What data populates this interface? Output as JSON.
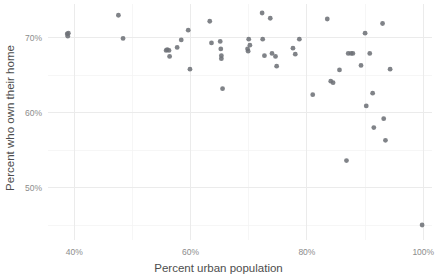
{
  "chart_data": {
    "type": "scatter",
    "title": "",
    "subtitle": "",
    "xlabel": "Percent urban population",
    "ylabel": "Percent who own their home",
    "xlim": [
      35.5,
      101.5
    ],
    "ylim": [
      43.0,
      74.5
    ],
    "x_ticks": [
      40,
      60,
      80,
      100
    ],
    "x_tick_labels": [
      "40%",
      "60%",
      "80%",
      "100%"
    ],
    "y_ticks": [
      50,
      60,
      70
    ],
    "y_tick_labels": [
      "50%",
      "60%",
      "70%"
    ],
    "x_minor_ticks": [
      50,
      70,
      90
    ],
    "y_minor_ticks": [
      45,
      55,
      65
    ],
    "grid": true,
    "legend": null,
    "point_color": "#6e7277",
    "grid_color": "#ebebeb",
    "background_color": "#ffffff",
    "n_points": 51,
    "points": [
      {
        "x": 38.8,
        "y": 70.5
      },
      {
        "x": 38.9,
        "y": 70.2
      },
      {
        "x": 39.0,
        "y": 70.6
      },
      {
        "x": 47.6,
        "y": 73.0
      },
      {
        "x": 48.4,
        "y": 69.9
      },
      {
        "x": 55.8,
        "y": 68.3
      },
      {
        "x": 56.0,
        "y": 68.4
      },
      {
        "x": 56.3,
        "y": 68.3
      },
      {
        "x": 56.4,
        "y": 67.5
      },
      {
        "x": 57.7,
        "y": 68.7
      },
      {
        "x": 58.4,
        "y": 69.7
      },
      {
        "x": 59.6,
        "y": 71.0
      },
      {
        "x": 59.9,
        "y": 65.8
      },
      {
        "x": 63.3,
        "y": 72.2
      },
      {
        "x": 63.6,
        "y": 69.3
      },
      {
        "x": 65.1,
        "y": 69.5
      },
      {
        "x": 65.2,
        "y": 68.5
      },
      {
        "x": 65.3,
        "y": 67.6
      },
      {
        "x": 65.3,
        "y": 67.2
      },
      {
        "x": 65.5,
        "y": 63.2
      },
      {
        "x": 69.8,
        "y": 68.5
      },
      {
        "x": 69.9,
        "y": 68.2
      },
      {
        "x": 70.0,
        "y": 69.8
      },
      {
        "x": 70.2,
        "y": 69.0
      },
      {
        "x": 72.3,
        "y": 73.3
      },
      {
        "x": 72.4,
        "y": 69.8
      },
      {
        "x": 72.7,
        "y": 67.6
      },
      {
        "x": 73.7,
        "y": 72.6
      },
      {
        "x": 74.0,
        "y": 67.9
      },
      {
        "x": 74.6,
        "y": 67.5
      },
      {
        "x": 74.8,
        "y": 66.2
      },
      {
        "x": 77.6,
        "y": 68.6
      },
      {
        "x": 78.0,
        "y": 67.8
      },
      {
        "x": 78.7,
        "y": 69.8
      },
      {
        "x": 81.0,
        "y": 62.4
      },
      {
        "x": 83.5,
        "y": 72.5
      },
      {
        "x": 84.1,
        "y": 64.2
      },
      {
        "x": 84.5,
        "y": 64.0
      },
      {
        "x": 85.6,
        "y": 65.7
      },
      {
        "x": 86.8,
        "y": 53.6
      },
      {
        "x": 87.1,
        "y": 67.9
      },
      {
        "x": 87.6,
        "y": 67.9
      },
      {
        "x": 87.9,
        "y": 67.9
      },
      {
        "x": 89.3,
        "y": 66.3
      },
      {
        "x": 90.0,
        "y": 70.6
      },
      {
        "x": 90.2,
        "y": 60.9
      },
      {
        "x": 90.8,
        "y": 67.9
      },
      {
        "x": 91.3,
        "y": 62.6
      },
      {
        "x": 91.5,
        "y": 58.0
      },
      {
        "x": 93.0,
        "y": 71.9
      },
      {
        "x": 93.2,
        "y": 59.2
      },
      {
        "x": 93.5,
        "y": 56.3
      },
      {
        "x": 94.3,
        "y": 65.8
      },
      {
        "x": 99.8,
        "y": 45.0
      }
    ]
  }
}
